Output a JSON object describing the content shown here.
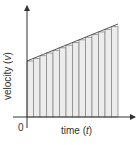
{
  "diagram": {
    "title": "",
    "xlabel": "time (t)",
    "xlabel_parts": {
      "pre": "time (",
      "var": "t",
      "post": ")"
    },
    "ylabel": "velocity (v)",
    "ylabel_parts": {
      "pre": "velocity (",
      "var": "v",
      "post": ")"
    },
    "origin_label": "0",
    "strip_count": 14,
    "line": {
      "from": "low-left",
      "to": "high-right",
      "type": "linear-increasing"
    },
    "colors": {
      "strip_fill": "#ececec",
      "strip_line": "#8a8a8a",
      "axis": "#333333",
      "slope_line": "#555555"
    }
  }
}
